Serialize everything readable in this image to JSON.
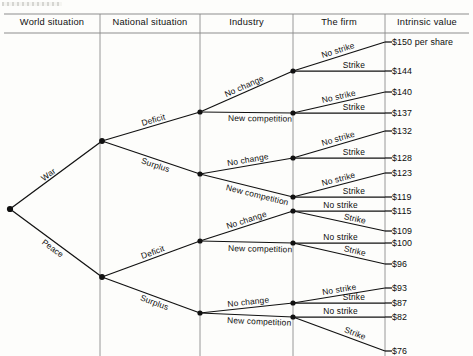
{
  "diagram": {
    "columns": [
      {
        "label": "World situation"
      },
      {
        "label": "National situation"
      },
      {
        "label": "Industry"
      },
      {
        "label": "The firm"
      },
      {
        "label": "Intrinsic value"
      }
    ],
    "branch_labels": {
      "world": [
        "War",
        "Peace"
      ],
      "national": [
        "Deficit",
        "Surplus"
      ],
      "industry": [
        "No change",
        "New competition"
      ],
      "firm": [
        "No strike",
        "Strike"
      ]
    },
    "nodes": {
      "root": {
        "x": 10,
        "y": 209
      },
      "world": [
        {
          "label": "War",
          "x": 102,
          "y": 141
        },
        {
          "label": "Peace",
          "x": 102,
          "y": 277
        }
      ],
      "national": [
        {
          "label": "Deficit",
          "x": 200,
          "y": 112
        },
        {
          "label": "Surplus",
          "x": 200,
          "y": 174
        },
        {
          "label": "Deficit",
          "x": 200,
          "y": 241
        },
        {
          "label": "Surplus",
          "x": 200,
          "y": 313
        }
      ],
      "industry": [
        {
          "label": "No change",
          "x": 293,
          "y": 71
        },
        {
          "label": "New competition",
          "x": 293,
          "y": 113
        },
        {
          "label": "No change",
          "x": 293,
          "y": 158
        },
        {
          "label": "New competition",
          "x": 293,
          "y": 197
        },
        {
          "label": "No change",
          "x": 293,
          "y": 211
        },
        {
          "label": "New competition",
          "x": 293,
          "y": 243
        },
        {
          "label": "No change",
          "x": 293,
          "y": 303
        },
        {
          "label": "New competition",
          "x": 293,
          "y": 317
        }
      ]
    },
    "leaves": [
      {
        "path": "War / Deficit / No change / No strike",
        "value": "$150 per share",
        "y": 42,
        "firm": "No strike"
      },
      {
        "path": "War / Deficit / No change / Strike",
        "value": "$144",
        "y": 71,
        "firm": "Strike"
      },
      {
        "path": "War / Deficit / New competition / No strike",
        "value": "$140",
        "y": 92,
        "firm": "No strike"
      },
      {
        "path": "War / Deficit / New competition / Strike",
        "value": "$137",
        "y": 113,
        "firm": "Strike"
      },
      {
        "path": "War / Surplus / No change / No strike",
        "value": "$132",
        "y": 131,
        "firm": "No strike"
      },
      {
        "path": "War / Surplus / No change / Strike",
        "value": "$128",
        "y": 158,
        "firm": "Strike"
      },
      {
        "path": "War / Surplus / New competition / No strike",
        "value": "$123",
        "y": 173,
        "firm": "No strike"
      },
      {
        "path": "War / Surplus / New competition / Strike",
        "value": "$119",
        "y": 197,
        "firm": "Strike"
      },
      {
        "path": "Peace / Deficit / No change / No strike",
        "value": "$115",
        "y": 211,
        "firm": "No strike"
      },
      {
        "path": "Peace / Deficit / No change / Strike",
        "value": "$109",
        "y": 231,
        "firm": "Strike"
      },
      {
        "path": "Peace / Deficit / New competition / No strike",
        "value": "$100",
        "y": 243,
        "firm": "No strike"
      },
      {
        "path": "Peace / Deficit / New competition / Strike",
        "value": "$96",
        "y": 264,
        "firm": "Strike"
      },
      {
        "path": "Peace / Surplus / No change / No strike",
        "value": "$93",
        "y": 288,
        "firm": "No strike"
      },
      {
        "path": "Peace / Surplus / No change / Strike",
        "value": "$87",
        "y": 303,
        "firm": "Strike"
      },
      {
        "path": "Peace / Surplus / New competition / No strike",
        "value": "$82",
        "y": 317,
        "firm": "No strike"
      },
      {
        "path": "Peace / Surplus / New competition / Strike",
        "value": "$76",
        "y": 351,
        "firm": "Strike"
      }
    ],
    "style": {
      "line_color": "#111111",
      "rule_color": "#8d8d8d",
      "node_color": "#111111",
      "background": "#fdfdfb"
    },
    "column_dividers_x": [
      100,
      200,
      293,
      385
    ],
    "header_rule_y": [
      14,
      33
    ],
    "chart_data": {
      "type": "tree",
      "title": "Intrinsic value decision tree",
      "levels": [
        "World situation",
        "National situation",
        "Industry",
        "The firm",
        "Intrinsic value"
      ],
      "categories": [
        "War/Deficit/No change/No strike",
        "War/Deficit/No change/Strike",
        "War/Deficit/New competition/No strike",
        "War/Deficit/New competition/Strike",
        "War/Surplus/No change/No strike",
        "War/Surplus/No change/Strike",
        "War/Surplus/New competition/No strike",
        "War/Surplus/New competition/Strike",
        "Peace/Deficit/No change/No strike",
        "Peace/Deficit/No change/Strike",
        "Peace/Deficit/New competition/No strike",
        "Peace/Deficit/New competition/Strike",
        "Peace/Surplus/No change/No strike",
        "Peace/Surplus/No change/Strike",
        "Peace/Surplus/New competition/No strike",
        "Peace/Surplus/New competition/Strike"
      ],
      "values": [
        150,
        144,
        140,
        137,
        132,
        128,
        123,
        119,
        115,
        109,
        100,
        96,
        93,
        87,
        82,
        76
      ],
      "unit": "per share",
      "ylabel": "Intrinsic value"
    }
  }
}
